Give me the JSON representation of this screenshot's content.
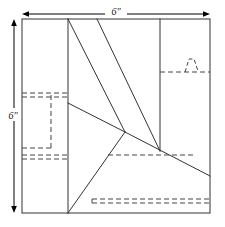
{
  "figure": {
    "units": "inches",
    "background_color": "#ffffff",
    "line_color": "#333333",
    "dim_line_color": "#000000",
    "hidden_line_color": "#444444"
  },
  "dimensions": {
    "top": {
      "label": "6\"",
      "name": "width-dimension",
      "orientation": "horizontal",
      "value": 6
    },
    "left": {
      "label": "6\"",
      "name": "height-dimension",
      "orientation": "vertical",
      "value": 6
    }
  },
  "geometry": {
    "square": {
      "x": 22,
      "y": 19,
      "w": 188,
      "h": 194
    },
    "solid_lines": [
      {
        "name": "square-border-top",
        "x1": 22,
        "y1": 19,
        "x2": 210,
        "y2": 19
      },
      {
        "name": "square-border-right",
        "x1": 210,
        "y1": 19,
        "x2": 210,
        "y2": 213
      },
      {
        "name": "square-border-bottom",
        "x1": 22,
        "y1": 213,
        "x2": 210,
        "y2": 213
      },
      {
        "name": "square-border-left",
        "x1": 22,
        "y1": 19,
        "x2": 22,
        "y2": 213
      },
      {
        "name": "vertical-fold-left",
        "x1": 68,
        "y1": 19,
        "x2": 68,
        "y2": 213
      },
      {
        "name": "vertical-fold-right",
        "x1": 160,
        "y1": 19,
        "x2": 160,
        "y2": 151
      },
      {
        "name": "diagonal-long-left",
        "x1": 68,
        "y1": 19,
        "x2": 125,
        "y2": 132
      },
      {
        "name": "diagonal-long-right",
        "x1": 97,
        "y1": 19,
        "x2": 160,
        "y2": 151
      },
      {
        "name": "diagonal-short-upper",
        "x1": 68,
        "y1": 103,
        "x2": 125,
        "y2": 132
      },
      {
        "name": "diagonal-to-bottom",
        "x1": 125,
        "y1": 132,
        "x2": 68,
        "y2": 213
      },
      {
        "name": "diagonal-to-right",
        "x1": 125,
        "y1": 132,
        "x2": 210,
        "y2": 176
      }
    ],
    "hidden_lines": [
      {
        "name": "hidden-rect-left-top-outer",
        "x1": 22,
        "y1": 93,
        "x2": 68,
        "y2": 93
      },
      {
        "name": "hidden-rect-left-top-inner",
        "x1": 22,
        "y1": 97,
        "x2": 68,
        "y2": 97
      },
      {
        "name": "hidden-rect-left-vertical",
        "x1": 51,
        "y1": 95,
        "x2": 51,
        "y2": 148
      },
      {
        "name": "hidden-rect-left-bottom",
        "x1": 22,
        "y1": 148,
        "x2": 51,
        "y2": 148
      },
      {
        "name": "hidden-rect-left-low-outer",
        "x1": 22,
        "y1": 155,
        "x2": 68,
        "y2": 155
      },
      {
        "name": "hidden-rect-left-low-inner",
        "x1": 22,
        "y1": 159,
        "x2": 68,
        "y2": 159
      },
      {
        "name": "hidden-line-upper-right",
        "x1": 160,
        "y1": 72,
        "x2": 210,
        "y2": 72
      },
      {
        "name": "hidden-line-middle",
        "x1": 108,
        "y1": 155,
        "x2": 196,
        "y2": 155
      },
      {
        "name": "hidden-line-bottom-outer",
        "x1": 92,
        "y1": 199,
        "x2": 210,
        "y2": 199
      },
      {
        "name": "hidden-line-bottom-inner",
        "x1": 92,
        "y1": 203,
        "x2": 210,
        "y2": 203
      }
    ],
    "hidden_zigzag": {
      "name": "hidden-zigzag-detail",
      "points": "185,72 189,60 193,60 197,72"
    },
    "vertices": [
      {
        "name": "convergence-point",
        "x": 125,
        "y": 132
      }
    ]
  }
}
